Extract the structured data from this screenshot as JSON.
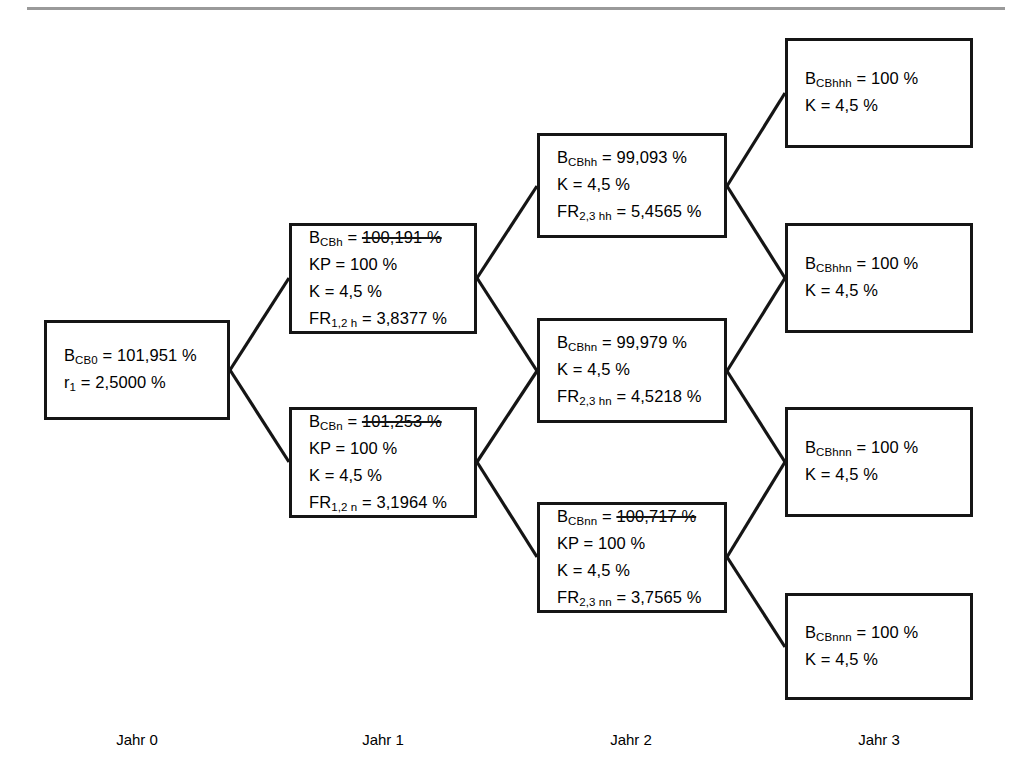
{
  "diagram": {
    "type": "binomial-interest-rate-tree",
    "nodes": [
      {
        "id": "cb0",
        "column": 0,
        "lines": [
          {
            "symbol": "B",
            "subscript": "CB0",
            "value": "101,951 %",
            "struck": false
          },
          {
            "symbol": "r",
            "subscript": "1",
            "value": "2,5000 %",
            "struck": false
          }
        ]
      },
      {
        "id": "cbh",
        "column": 1,
        "lines": [
          {
            "symbol": "B",
            "subscript": "CBh",
            "value": "100,191 %",
            "struck": true
          },
          {
            "symbol": "KP",
            "subscript": "",
            "value": "100 %",
            "struck": false
          },
          {
            "symbol": "K",
            "subscript": "",
            "value": "4,5 %",
            "struck": false
          },
          {
            "symbol": "FR",
            "subscript": "1,2 h",
            "value": "3,8377 %",
            "struck": false
          }
        ]
      },
      {
        "id": "cbn",
        "column": 1,
        "lines": [
          {
            "symbol": "B",
            "subscript": "CBn",
            "value": "101,253 %",
            "struck": true
          },
          {
            "symbol": "KP",
            "subscript": "",
            "value": "100 %",
            "struck": false
          },
          {
            "symbol": "K",
            "subscript": "",
            "value": "4,5 %",
            "struck": false
          },
          {
            "symbol": "FR",
            "subscript": "1,2 n",
            "value": "3,1964 %",
            "struck": false
          }
        ]
      },
      {
        "id": "cbhh",
        "column": 2,
        "lines": [
          {
            "symbol": "B",
            "subscript": "CBhh",
            "value": "99,093 %",
            "struck": false
          },
          {
            "symbol": "K",
            "subscript": "",
            "value": "4,5 %",
            "struck": false
          },
          {
            "symbol": "FR",
            "subscript": "2,3 hh",
            "value": "5,4565 %",
            "struck": false
          }
        ]
      },
      {
        "id": "cbhn",
        "column": 2,
        "lines": [
          {
            "symbol": "B",
            "subscript": "CBhn",
            "value": "99,979 %",
            "struck": false
          },
          {
            "symbol": "K",
            "subscript": "",
            "value": "4,5 %",
            "struck": false
          },
          {
            "symbol": "FR",
            "subscript": "2,3 hn",
            "value": "4,5218 %",
            "struck": false
          }
        ]
      },
      {
        "id": "cbnn",
        "column": 2,
        "lines": [
          {
            "symbol": "B",
            "subscript": "CBnn",
            "value": "100,717 %",
            "struck": true
          },
          {
            "symbol": "KP",
            "subscript": "",
            "value": "100 %",
            "struck": false
          },
          {
            "symbol": "K",
            "subscript": "",
            "value": "4,5 %",
            "struck": false
          },
          {
            "symbol": "FR",
            "subscript": "2,3 nn",
            "value": "3,7565 %",
            "struck": false
          }
        ]
      },
      {
        "id": "cbhhh",
        "column": 3,
        "lines": [
          {
            "symbol": "B",
            "subscript": "CBhhh",
            "value": "100 %",
            "struck": false
          },
          {
            "symbol": "K",
            "subscript": "",
            "value": "4,5 %",
            "struck": false
          }
        ]
      },
      {
        "id": "cbhhn",
        "column": 3,
        "lines": [
          {
            "symbol": "B",
            "subscript": "CBhhn",
            "value": "100 %",
            "struck": false
          },
          {
            "symbol": "K",
            "subscript": "",
            "value": "4,5 %",
            "struck": false
          }
        ]
      },
      {
        "id": "cbhnn",
        "column": 3,
        "lines": [
          {
            "symbol": "B",
            "subscript": "CBhnn",
            "value": "100 %",
            "struck": false
          },
          {
            "symbol": "K",
            "subscript": "",
            "value": "4,5 %",
            "struck": false
          }
        ]
      },
      {
        "id": "cbnnn",
        "column": 3,
        "lines": [
          {
            "symbol": "B",
            "subscript": "CBnnn",
            "value": "100 %",
            "struck": false
          },
          {
            "symbol": "K",
            "subscript": "",
            "value": "4,5 %",
            "struck": false
          }
        ]
      }
    ],
    "year_labels": [
      {
        "id": "jahr0",
        "text": "Jahr 0"
      },
      {
        "id": "jahr1",
        "text": "Jahr 1"
      },
      {
        "id": "jahr2",
        "text": "Jahr 2"
      },
      {
        "id": "jahr3",
        "text": "Jahr 3"
      }
    ],
    "colors": {
      "box_border": "#151515",
      "edge_line": "#151515",
      "header_rule": "#9a9a9a",
      "background": "#ffffff",
      "text": "#000000"
    }
  }
}
